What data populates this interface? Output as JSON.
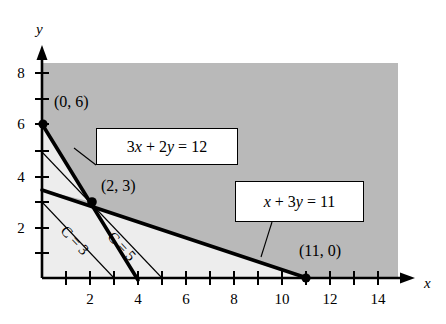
{
  "figure": {
    "type": "linear-programming-graph",
    "background": "#ffffff",
    "shaded_region_color": "#b8b8b8",
    "feasible_region_color": "#ececec",
    "line_color": "#000000"
  },
  "axes": {
    "x_axis_label": "x",
    "y_axis_label": "y",
    "x_ticks": [
      {
        "value": 2,
        "label": "2"
      },
      {
        "value": 4,
        "label": "4"
      },
      {
        "value": 6,
        "label": "6"
      },
      {
        "value": 8,
        "label": "8"
      },
      {
        "value": 10,
        "label": "10"
      },
      {
        "value": 12,
        "label": "12"
      },
      {
        "value": 14,
        "label": "14"
      }
    ],
    "y_ticks": [
      {
        "value": 2,
        "label": "2"
      },
      {
        "value": 4,
        "label": "4"
      },
      {
        "value": 6,
        "label": "6"
      },
      {
        "value": 8,
        "label": "8"
      }
    ],
    "x_minor_ticks": [
      1,
      3,
      5,
      7,
      9,
      11,
      13
    ],
    "y_minor_ticks": [
      1,
      3,
      5,
      7
    ],
    "x_range": [
      0,
      15
    ],
    "y_range": [
      0,
      9
    ]
  },
  "constraints": [
    {
      "id": "constraint-1",
      "label": "3x + 2y = 12",
      "label_parts": {
        "a": "3",
        "x": "x",
        "plus": " + ",
        "b": "2",
        "y": "y",
        "eq": " = ",
        "rhs": "12"
      },
      "x_intercept": 4,
      "y_intercept": 6
    },
    {
      "id": "constraint-2",
      "label": "x + 3y = 11",
      "label_parts": {
        "x": "x",
        "plus": " + ",
        "b": "3",
        "y": "y",
        "eq": " = ",
        "rhs": "11"
      },
      "x_intercept": 11,
      "y_intercept": 3.6667
    }
  ],
  "objective_contours": [
    {
      "id": "contour-c3",
      "label": "C = 3",
      "value": 3,
      "x_intercept": 3,
      "y_intercept": 3
    },
    {
      "id": "contour-c5",
      "label": "C = 5",
      "value": 5,
      "x_intercept": 5,
      "y_intercept": 5
    }
  ],
  "points": [
    {
      "id": "vertex-0-6",
      "label": "(0, 6)",
      "x": 0,
      "y": 6,
      "marked": true
    },
    {
      "id": "vertex-2-3",
      "label": "(2, 3)",
      "x": 2,
      "y": 3,
      "marked": true
    },
    {
      "id": "vertex-11-0",
      "label": "(11, 0)",
      "x": 11,
      "y": 0,
      "marked": true
    }
  ]
}
